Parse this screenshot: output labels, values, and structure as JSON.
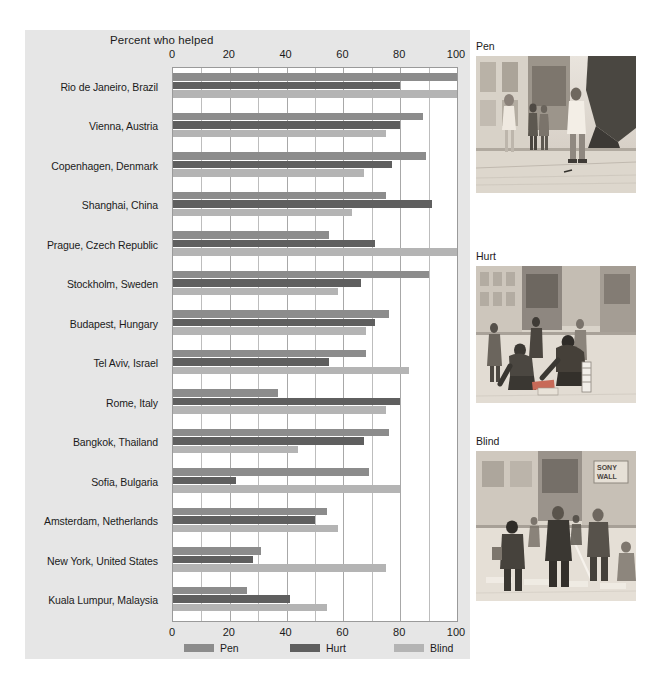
{
  "chart_data": {
    "type": "bar",
    "orientation": "horizontal",
    "title": "Percent who helped",
    "xlabel": "",
    "ylabel": "",
    "xlim": [
      0,
      100
    ],
    "xticks": [
      0,
      20,
      40,
      60,
      80,
      100
    ],
    "grid": true,
    "grid_axis": "x",
    "legend_position": "bottom",
    "axis_duplicated_top_and_bottom": true,
    "categories": [
      "Rio de Janeiro, Brazil",
      "Vienna, Austria",
      "Copenhagen, Denmark",
      "Shanghai, China",
      "Prague, Czech Republic",
      "Stockholm, Sweden",
      "Budapest, Hungary",
      "Tel Aviv, Israel",
      "Rome, Italy",
      "Bangkok, Thailand",
      "Sofia, Bulgaria",
      "Amsterdam, Netherlands",
      "New York, United States",
      "Kuala Lumpur, Malaysia"
    ],
    "series": [
      {
        "name": "Pen",
        "color": "#8c8c8c",
        "values": [
          100,
          88,
          89,
          75,
          55,
          90,
          76,
          68,
          37,
          76,
          69,
          54,
          31,
          26
        ]
      },
      {
        "name": "Hurt",
        "color": "#5f5f5f",
        "values": [
          80,
          80,
          77,
          91,
          71,
          66,
          71,
          55,
          80,
          67,
          22,
          50,
          28,
          41
        ]
      },
      {
        "name": "Blind",
        "color": "#b4b4b4",
        "values": [
          100,
          75,
          67,
          63,
          100,
          58,
          68,
          83,
          75,
          44,
          80,
          58,
          75,
          54
        ]
      }
    ]
  },
  "legend": {
    "items": [
      {
        "label": "Pen",
        "color": "#8c8c8c"
      },
      {
        "label": "Hurt",
        "color": "#5f5f5f"
      },
      {
        "label": "Blind",
        "color": "#b4b4b4"
      }
    ]
  },
  "photos": [
    {
      "caption": "Pen",
      "scene": "pedestrians-on-street-dropped-pen"
    },
    {
      "caption": "Hurt",
      "scene": "person-with-leg-brace-dropped-magazines"
    },
    {
      "caption": "Blind",
      "scene": "blind-person-with-cane-at-crosswalk"
    }
  ],
  "artifacts": {
    "top_text": "",
    "bottom_caption": ""
  }
}
